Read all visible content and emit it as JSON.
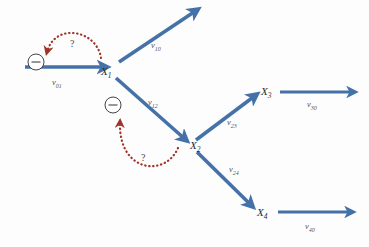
{
  "figure": {
    "type": "directed-graph-diagram",
    "background_color": "#fdfdfd",
    "arrow_color": "#4472a8",
    "dotted_arc_color": "#a0342a",
    "label_color": "#555555",
    "node_label_color": "#2b2b2b"
  },
  "nodes": [
    {
      "id": "x1",
      "label": "X",
      "sub": "1",
      "x": 101,
      "y": 66
    },
    {
      "id": "x2",
      "label": "X",
      "sub": "2",
      "x": 190,
      "y": 140
    },
    {
      "id": "x3",
      "label": "X",
      "sub": "3",
      "x": 261,
      "y": 86
    },
    {
      "id": "x4",
      "label": "X",
      "sub": "4",
      "x": 257,
      "y": 207
    }
  ],
  "edges": [
    {
      "id": "v01",
      "label": "v",
      "sub": "01",
      "lx": 52,
      "ly": 78
    },
    {
      "id": "v10",
      "label": "v",
      "sub": "10",
      "lx": 151,
      "ly": 41
    },
    {
      "id": "v12",
      "label": "v",
      "sub": "12",
      "lx": 148,
      "ly": 98
    },
    {
      "id": "v23",
      "label": "v",
      "sub": "23",
      "lx": 227,
      "ly": 118
    },
    {
      "id": "v24",
      "label": "v",
      "sub": "24",
      "lx": 229,
      "ly": 165
    },
    {
      "id": "v30",
      "label": "v",
      "sub": "30",
      "lx": 307,
      "ly": 100
    },
    {
      "id": "v40",
      "label": "v",
      "sub": "40",
      "lx": 305,
      "ly": 222
    }
  ],
  "annotations": [
    {
      "id": "question-1",
      "text": "?",
      "x": 70,
      "y": 39
    },
    {
      "id": "question-2",
      "text": "?",
      "x": 141,
      "y": 153
    }
  ],
  "minus_markers": [
    {
      "id": "minus-1",
      "symbol": "−",
      "cx": 36,
      "cy": 62,
      "r": 8
    },
    {
      "id": "minus-2",
      "symbol": "−",
      "cx": 113,
      "cy": 105,
      "r": 8
    }
  ]
}
